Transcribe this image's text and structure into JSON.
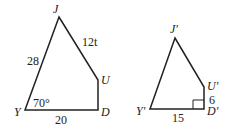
{
  "figure_left": {
    "vertices": {
      "J": "J",
      "U": "U",
      "D": "D",
      "Y": "Y"
    },
    "side_YJ": "28",
    "side_JU": "12t",
    "side_YD": "20",
    "angle_Y": "70°"
  },
  "figure_right": {
    "vertices": {
      "J": "J′",
      "U": "U′",
      "D": "D′",
      "Y": "Y′"
    },
    "side_UD": "6",
    "side_YD": "15",
    "right_angle_at": "D′"
  },
  "colors": {
    "stroke": "#222222",
    "background": "#ffffff"
  }
}
